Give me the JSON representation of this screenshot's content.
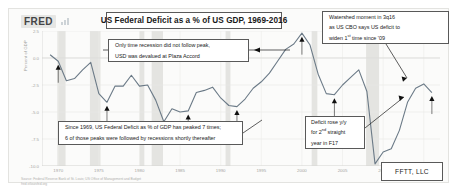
{
  "chart_data": {
    "type": "line",
    "title": "US Federal Deficit as a % of US GDP, 1969-2016",
    "xlabel": "",
    "ylabel": "Percent of GDP",
    "xlim": [
      1968,
      2017
    ],
    "ylim": [
      -10.0,
      2.5
    ],
    "ytick_labels": [
      "2.5",
      "0.0",
      "-2.5",
      "-5.0",
      "-7.5",
      "-10.0"
    ],
    "ytick_values": [
      2.5,
      0.0,
      -2.5,
      -5.0,
      -7.5,
      -10.0
    ],
    "xtick_labels": [
      "1970",
      "1975",
      "1980",
      "1985",
      "1990",
      "1995",
      "2000",
      "2005",
      "2010",
      "2015"
    ],
    "xtick_values": [
      1970,
      1975,
      1980,
      1985,
      1990,
      1995,
      2000,
      2005,
      2010,
      2015
    ],
    "grid": true,
    "legend": "none",
    "line_color": "#6b7a87",
    "recession_band_color": "#e4e4e1",
    "series": [
      {
        "name": "US Federal Deficit as a % of US GDP",
        "x": [
          1969,
          1970,
          1971,
          1972,
          1973,
          1974,
          1975,
          1976,
          1977,
          1978,
          1979,
          1980,
          1981,
          1982,
          1983,
          1984,
          1985,
          1986,
          1987,
          1988,
          1989,
          1990,
          1991,
          1992,
          1993,
          1994,
          1995,
          1996,
          1997,
          1998,
          1999,
          2000,
          2001,
          2002,
          2003,
          2004,
          2005,
          2006,
          2007,
          2008,
          2009,
          2010,
          2011,
          2012,
          2013,
          2014,
          2015,
          2016
        ],
        "values": [
          0.3,
          -0.3,
          -2.1,
          -1.9,
          -1.1,
          -0.4,
          -3.3,
          -4.1,
          -2.6,
          -2.6,
          -1.6,
          -2.6,
          -2.5,
          -3.9,
          -5.9,
          -4.7,
          -5.0,
          -4.9,
          -3.2,
          -3.0,
          -2.7,
          -3.7,
          -4.4,
          -4.5,
          -3.8,
          -2.8,
          -2.2,
          -1.4,
          -0.3,
          0.8,
          1.3,
          2.3,
          1.2,
          -1.5,
          -3.3,
          -3.4,
          -2.5,
          -1.8,
          -1.1,
          -3.1,
          -9.8,
          -8.7,
          -8.4,
          -6.7,
          -4.1,
          -2.8,
          -2.4,
          -3.2
        ]
      }
    ],
    "peak_markers": {
      "description": "black arrow markers at deficit peaks",
      "count": 9,
      "x": [
        1970,
        1976,
        1983,
        1986,
        1992,
        2000,
        2004,
        2009,
        2016
      ]
    },
    "recession_bands": [
      [
        1969.9,
        1970.9
      ],
      [
        1973.9,
        1975.2
      ],
      [
        1980.0,
        1980.6
      ],
      [
        1981.5,
        1982.9
      ],
      [
        1990.6,
        1991.2
      ],
      [
        2001.2,
        2001.9
      ],
      [
        2007.9,
        2009.5
      ]
    ]
  },
  "fred": {
    "logo": "FRED",
    "logo_icon": "bar-chart-icon",
    "source_line1": "Source: Federal Reserve Bank of St. Louis; US Office of Management and Budget",
    "source_line2": "fred.stlouisfed.org"
  },
  "callouts": {
    "title": "US Federal Deficit as a % of US GDP, 1969-2016",
    "plaza": {
      "line1": "Only time recession did not follow peak,",
      "line2": "USD was devalued at Plaza Accord"
    },
    "watershed": {
      "line1": "Watershed moment in 3q16",
      "line2": "as US CBO says US deficit to",
      "line3_a": "widen 1",
      "line3_sup": "st",
      "line3_b": " time since '09"
    },
    "peaks": {
      "line1": "Since 1969, US Federal Deficit as % of GDP has peaked 7 times;",
      "line2": "6 of those peaks were followed by recessions shortly thereafter"
    },
    "yoy": {
      "line1": "Deficit rose y/y",
      "line2_a": "for 2",
      "line2_sup": "nd",
      "line2_b": " straight",
      "line3": "year in F17"
    },
    "branding": "FFTT, LLC"
  }
}
